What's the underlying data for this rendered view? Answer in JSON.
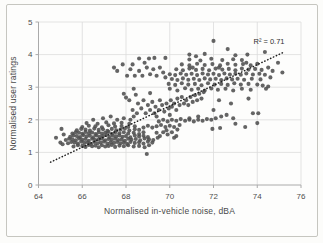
{
  "chart_data": {
    "type": "scatter",
    "xlabel": "Normalised in-vehicle noise, dBA",
    "ylabel": "Normalised user ratings",
    "xlim": [
      64,
      76
    ],
    "ylim": [
      0,
      5
    ],
    "x_ticks": [
      64,
      66,
      68,
      70,
      72,
      74,
      76
    ],
    "y_ticks": [
      0,
      1,
      2,
      3,
      4,
      5
    ],
    "grid": true,
    "legend": "none",
    "annotation": {
      "text": "R² = 0.71",
      "x": 74.5,
      "y": 4.23
    },
    "trendline": {
      "style": "dotted",
      "color": "#1c1c1c",
      "x1": 64.55,
      "y1": 0.7,
      "x2": 75.2,
      "y2": 4.07
    },
    "point_color": "#4e4e4e",
    "grid_color": "#dcdcdc",
    "axis_color": "#aaaaaa",
    "text_color": "#4d4d4d",
    "points": [
      [
        65.6,
        1.18
      ],
      [
        65.8,
        1.22
      ],
      [
        66.0,
        1.2
      ],
      [
        66.15,
        1.17
      ],
      [
        66.3,
        1.23
      ],
      [
        66.45,
        1.19
      ],
      [
        66.6,
        1.21
      ],
      [
        66.75,
        1.16
      ],
      [
        66.9,
        1.22
      ],
      [
        67.05,
        1.18
      ],
      [
        67.2,
        1.2
      ],
      [
        67.35,
        1.23
      ],
      [
        67.5,
        1.17
      ],
      [
        67.7,
        1.21
      ],
      [
        67.9,
        1.19
      ],
      [
        68.1,
        1.22
      ],
      [
        68.35,
        1.18
      ],
      [
        68.6,
        1.2
      ],
      [
        68.85,
        1.16
      ],
      [
        69.05,
        1.22
      ],
      [
        65.35,
        1.28
      ],
      [
        65.5,
        1.32
      ],
      [
        65.65,
        1.3
      ],
      [
        65.8,
        1.27
      ],
      [
        65.95,
        1.33
      ],
      [
        66.1,
        1.29
      ],
      [
        66.25,
        1.31
      ],
      [
        66.4,
        1.26
      ],
      [
        66.55,
        1.32
      ],
      [
        66.7,
        1.28
      ],
      [
        66.85,
        1.3
      ],
      [
        67.0,
        1.33
      ],
      [
        67.15,
        1.27
      ],
      [
        67.3,
        1.31
      ],
      [
        67.45,
        1.29
      ],
      [
        67.6,
        1.32
      ],
      [
        67.75,
        1.28
      ],
      [
        67.9,
        1.3
      ],
      [
        68.05,
        1.26
      ],
      [
        68.2,
        1.32
      ],
      [
        68.4,
        1.29
      ],
      [
        68.6,
        1.31
      ],
      [
        68.8,
        1.27
      ],
      [
        69.0,
        1.33
      ],
      [
        69.2,
        1.3
      ],
      [
        65.25,
        1.38
      ],
      [
        65.4,
        1.42
      ],
      [
        65.55,
        1.4
      ],
      [
        65.7,
        1.37
      ],
      [
        65.85,
        1.43
      ],
      [
        66.0,
        1.39
      ],
      [
        66.15,
        1.41
      ],
      [
        66.3,
        1.36
      ],
      [
        66.45,
        1.42
      ],
      [
        66.6,
        1.38
      ],
      [
        66.75,
        1.4
      ],
      [
        66.9,
        1.43
      ],
      [
        67.05,
        1.37
      ],
      [
        67.2,
        1.41
      ],
      [
        67.35,
        1.39
      ],
      [
        67.5,
        1.42
      ],
      [
        67.65,
        1.38
      ],
      [
        67.8,
        1.4
      ],
      [
        67.95,
        1.36
      ],
      [
        68.1,
        1.42
      ],
      [
        68.25,
        1.39
      ],
      [
        68.45,
        1.41
      ],
      [
        68.65,
        1.37
      ],
      [
        68.85,
        1.43
      ],
      [
        69.05,
        1.4
      ],
      [
        69.25,
        1.38
      ],
      [
        65.45,
        1.48
      ],
      [
        65.6,
        1.52
      ],
      [
        65.75,
        1.5
      ],
      [
        65.9,
        1.47
      ],
      [
        66.05,
        1.53
      ],
      [
        66.2,
        1.49
      ],
      [
        66.35,
        1.51
      ],
      [
        66.5,
        1.46
      ],
      [
        66.65,
        1.52
      ],
      [
        66.8,
        1.48
      ],
      [
        66.95,
        1.5
      ],
      [
        67.1,
        1.53
      ],
      [
        67.25,
        1.47
      ],
      [
        67.4,
        1.51
      ],
      [
        67.55,
        1.49
      ],
      [
        67.7,
        1.52
      ],
      [
        67.85,
        1.48
      ],
      [
        68.0,
        1.5
      ],
      [
        68.2,
        1.46
      ],
      [
        68.4,
        1.52
      ],
      [
        68.6,
        1.49
      ],
      [
        68.8,
        1.51
      ],
      [
        69.0,
        1.47
      ],
      [
        65.55,
        1.58
      ],
      [
        65.7,
        1.62
      ],
      [
        65.85,
        1.6
      ],
      [
        66.0,
        1.57
      ],
      [
        66.15,
        1.63
      ],
      [
        66.3,
        1.59
      ],
      [
        66.45,
        1.61
      ],
      [
        66.6,
        1.56
      ],
      [
        66.75,
        1.62
      ],
      [
        66.9,
        1.58
      ],
      [
        67.05,
        1.6
      ],
      [
        67.2,
        1.63
      ],
      [
        67.35,
        1.57
      ],
      [
        67.5,
        1.61
      ],
      [
        67.7,
        1.59
      ],
      [
        67.9,
        1.62
      ],
      [
        68.1,
        1.58
      ],
      [
        68.35,
        1.6
      ],
      [
        68.6,
        1.56
      ],
      [
        68.8,
        1.62
      ],
      [
        65.75,
        1.68
      ],
      [
        65.95,
        1.72
      ],
      [
        66.15,
        1.7
      ],
      [
        66.35,
        1.67
      ],
      [
        66.55,
        1.73
      ],
      [
        66.75,
        1.69
      ],
      [
        66.95,
        1.71
      ],
      [
        67.15,
        1.66
      ],
      [
        67.35,
        1.72
      ],
      [
        67.55,
        1.68
      ],
      [
        67.75,
        1.7
      ],
      [
        67.95,
        1.73
      ],
      [
        68.15,
        1.67
      ],
      [
        68.4,
        1.71
      ],
      [
        68.6,
        1.69
      ],
      [
        66.0,
        1.78
      ],
      [
        66.3,
        1.82
      ],
      [
        66.6,
        1.8
      ],
      [
        66.9,
        1.77
      ],
      [
        67.2,
        1.83
      ],
      [
        67.5,
        1.79
      ],
      [
        67.8,
        1.81
      ],
      [
        68.1,
        1.78
      ],
      [
        68.4,
        1.8
      ],
      [
        66.2,
        1.9
      ],
      [
        66.7,
        1.88
      ],
      [
        67.1,
        1.92
      ],
      [
        67.45,
        1.89
      ],
      [
        67.8,
        1.91
      ],
      [
        68.15,
        1.88
      ],
      [
        66.5,
        2.0
      ],
      [
        66.95,
        2.05
      ],
      [
        67.3,
        2.1
      ],
      [
        67.6,
        2.0
      ],
      [
        67.9,
        2.05
      ],
      [
        68.2,
        2.0
      ],
      [
        68.35,
        2.1
      ],
      [
        64.8,
        1.45
      ],
      [
        65.0,
        1.3
      ],
      [
        65.05,
        1.72
      ],
      [
        65.1,
        1.25
      ],
      [
        65.15,
        1.55
      ],
      [
        68.95,
        0.95
      ],
      [
        69.4,
        1.6
      ],
      [
        69.55,
        1.5
      ],
      [
        69.7,
        1.62
      ],
      [
        69.9,
        1.55
      ],
      [
        70.1,
        1.62
      ],
      [
        70.3,
        1.5
      ],
      [
        69.45,
        1.45
      ],
      [
        69.85,
        1.68
      ],
      [
        70.2,
        1.45
      ],
      [
        68.8,
        1.76
      ],
      [
        69.0,
        1.82
      ],
      [
        69.2,
        1.76
      ],
      [
        69.4,
        1.8
      ],
      [
        69.6,
        1.84
      ],
      [
        69.8,
        1.78
      ],
      [
        70.0,
        1.82
      ],
      [
        70.2,
        1.78
      ],
      [
        70.45,
        1.84
      ],
      [
        69.5,
        1.95
      ],
      [
        69.7,
        2.0
      ],
      [
        69.9,
        1.95
      ],
      [
        70.1,
        2.0
      ],
      [
        70.3,
        1.97
      ],
      [
        70.5,
        2.02
      ],
      [
        70.7,
        1.97
      ],
      [
        70.9,
        2.0
      ],
      [
        71.1,
        1.95
      ],
      [
        71.3,
        2.0
      ],
      [
        71.5,
        1.97
      ],
      [
        71.7,
        2.02
      ],
      [
        71.9,
        2.0
      ],
      [
        72.1,
        2.05
      ],
      [
        72.35,
        2.1
      ],
      [
        72.6,
        2.15
      ],
      [
        68.0,
        2.68
      ],
      [
        68.15,
        2.6
      ],
      [
        68.3,
        2.3
      ],
      [
        68.5,
        2.2
      ],
      [
        68.55,
        2.5
      ],
      [
        68.7,
        2.35
      ],
      [
        68.8,
        2.6
      ],
      [
        68.9,
        2.2
      ],
      [
        69.0,
        2.45
      ],
      [
        69.1,
        2.3
      ],
      [
        69.2,
        2.55
      ],
      [
        69.3,
        2.2
      ],
      [
        69.35,
        2.4
      ],
      [
        69.4,
        2.1
      ],
      [
        69.5,
        2.3
      ],
      [
        69.55,
        2.6
      ],
      [
        69.65,
        2.45
      ],
      [
        69.75,
        2.25
      ],
      [
        69.85,
        2.5
      ],
      [
        69.95,
        2.35
      ],
      [
        70.0,
        2.15
      ],
      [
        70.05,
        2.6
      ],
      [
        70.1,
        2.4
      ],
      [
        70.2,
        2.5
      ],
      [
        70.3,
        2.3
      ],
      [
        70.35,
        2.65
      ],
      [
        70.45,
        2.45
      ],
      [
        70.55,
        2.7
      ],
      [
        70.65,
        2.5
      ],
      [
        70.75,
        2.6
      ],
      [
        70.85,
        2.45
      ],
      [
        70.95,
        2.7
      ],
      [
        71.05,
        2.55
      ],
      [
        71.15,
        2.75
      ],
      [
        71.25,
        2.6
      ],
      [
        71.35,
        2.8
      ],
      [
        71.45,
        2.65
      ],
      [
        71.55,
        2.85
      ],
      [
        67.9,
        2.8
      ],
      [
        68.35,
        2.95
      ],
      [
        67.6,
        3.5
      ],
      [
        67.85,
        3.7
      ],
      [
        68.05,
        3.35
      ],
      [
        68.2,
        3.55
      ],
      [
        68.4,
        3.35
      ],
      [
        68.6,
        3.5
      ],
      [
        68.75,
        3.35
      ],
      [
        68.95,
        3.6
      ],
      [
        69.1,
        3.4
      ],
      [
        69.25,
        3.55
      ],
      [
        69.4,
        3.35
      ],
      [
        69.55,
        3.6
      ],
      [
        69.7,
        3.45
      ],
      [
        69.8,
        3.3
      ],
      [
        68.3,
        3.7
      ],
      [
        68.85,
        3.75
      ],
      [
        67.45,
        3.6
      ],
      [
        68.6,
        3.88
      ],
      [
        69.05,
        3.88
      ],
      [
        69.3,
        3.9
      ],
      [
        69.8,
        3.9
      ],
      [
        68.45,
        2.77
      ],
      [
        69.1,
        2.82
      ],
      [
        70.35,
        1.7
      ],
      [
        70.9,
        2.05
      ],
      [
        71.3,
        2.1
      ],
      [
        71.95,
        1.72
      ],
      [
        72.3,
        1.75
      ],
      [
        72.9,
        2.05
      ],
      [
        73.0,
        1.88
      ],
      [
        73.45,
        1.78
      ],
      [
        73.8,
        2.2
      ],
      [
        74.05,
        2.2
      ],
      [
        74.0,
        1.9
      ],
      [
        73.6,
        2.65
      ],
      [
        72.25,
        2.6
      ],
      [
        72.8,
        2.5
      ],
      [
        72.0,
        2.3
      ],
      [
        70.0,
        2.95
      ],
      [
        70.35,
        2.9
      ],
      [
        70.7,
        2.97
      ],
      [
        71.0,
        2.92
      ],
      [
        71.3,
        2.95
      ],
      [
        71.6,
        2.9
      ],
      [
        71.9,
        2.96
      ],
      [
        72.2,
        2.92
      ],
      [
        72.55,
        2.95
      ],
      [
        72.9,
        2.9
      ],
      [
        73.3,
        2.95
      ],
      [
        73.7,
        2.92
      ],
      [
        69.95,
        3.1
      ],
      [
        70.25,
        3.07
      ],
      [
        70.55,
        3.12
      ],
      [
        70.85,
        3.08
      ],
      [
        71.15,
        3.1
      ],
      [
        71.45,
        3.06
      ],
      [
        71.75,
        3.12
      ],
      [
        72.05,
        3.08
      ],
      [
        72.35,
        3.1
      ],
      [
        72.65,
        3.07
      ],
      [
        72.95,
        3.12
      ],
      [
        73.25,
        3.08
      ],
      [
        73.6,
        3.1
      ],
      [
        74.0,
        3.08
      ],
      [
        70.1,
        3.25
      ],
      [
        70.35,
        3.22
      ],
      [
        70.6,
        3.27
      ],
      [
        70.85,
        3.23
      ],
      [
        71.1,
        3.26
      ],
      [
        71.35,
        3.22
      ],
      [
        71.6,
        3.27
      ],
      [
        71.85,
        3.24
      ],
      [
        72.1,
        3.26
      ],
      [
        72.35,
        3.22
      ],
      [
        72.6,
        3.27
      ],
      [
        72.85,
        3.24
      ],
      [
        73.1,
        3.26
      ],
      [
        73.4,
        3.23
      ],
      [
        73.75,
        3.26
      ],
      [
        74.15,
        3.24
      ],
      [
        70.0,
        3.4
      ],
      [
        70.25,
        3.37
      ],
      [
        70.5,
        3.42
      ],
      [
        70.75,
        3.38
      ],
      [
        71.0,
        3.41
      ],
      [
        71.25,
        3.37
      ],
      [
        71.5,
        3.42
      ],
      [
        71.75,
        3.39
      ],
      [
        72.0,
        3.41
      ],
      [
        72.25,
        3.37
      ],
      [
        72.5,
        3.42
      ],
      [
        72.75,
        3.39
      ],
      [
        73.0,
        3.41
      ],
      [
        73.25,
        3.38
      ],
      [
        73.5,
        3.42
      ],
      [
        73.8,
        3.39
      ],
      [
        74.1,
        3.41
      ],
      [
        74.35,
        3.38
      ],
      [
        70.3,
        3.55
      ],
      [
        70.6,
        3.52
      ],
      [
        70.9,
        3.57
      ],
      [
        71.2,
        3.53
      ],
      [
        71.5,
        3.56
      ],
      [
        71.8,
        3.52
      ],
      [
        72.1,
        3.57
      ],
      [
        72.4,
        3.54
      ],
      [
        72.7,
        3.56
      ],
      [
        73.0,
        3.52
      ],
      [
        73.3,
        3.57
      ],
      [
        73.6,
        3.54
      ],
      [
        73.9,
        3.56
      ],
      [
        74.2,
        3.53
      ],
      [
        71.05,
        3.6
      ],
      [
        72.25,
        3.6
      ],
      [
        70.55,
        3.7
      ],
      [
        70.9,
        3.67
      ],
      [
        71.25,
        3.72
      ],
      [
        71.6,
        3.68
      ],
      [
        71.95,
        3.71
      ],
      [
        72.3,
        3.67
      ],
      [
        72.65,
        3.72
      ],
      [
        73.0,
        3.69
      ],
      [
        73.35,
        3.71
      ],
      [
        73.7,
        3.67
      ],
      [
        74.0,
        3.72
      ],
      [
        73.5,
        3.75
      ],
      [
        70.9,
        3.85
      ],
      [
        71.4,
        3.82
      ],
      [
        71.9,
        3.87
      ],
      [
        72.4,
        3.83
      ],
      [
        72.9,
        3.86
      ],
      [
        73.3,
        3.83
      ],
      [
        72.0,
        4.42
      ],
      [
        72.65,
        4.17
      ],
      [
        74.35,
        4.08
      ],
      [
        70.9,
        4.0
      ],
      [
        71.6,
        4.02
      ],
      [
        73.0,
        3.98
      ],
      [
        73.55,
        4.0
      ],
      [
        71.2,
        3.95
      ],
      [
        74.5,
        3.6
      ],
      [
        74.7,
        3.5
      ],
      [
        74.95,
        3.75
      ],
      [
        75.15,
        3.45
      ],
      [
        74.25,
        3.05
      ],
      [
        74.5,
        3.02
      ],
      [
        74.4,
        2.95
      ],
      [
        74.6,
        3.3
      ]
    ]
  }
}
